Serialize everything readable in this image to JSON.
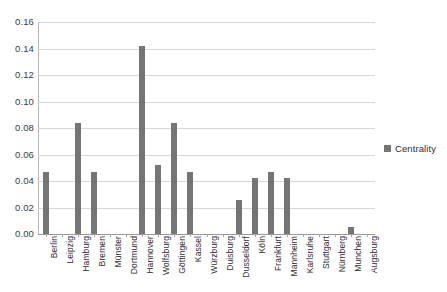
{
  "chart_data": {
    "type": "bar",
    "title": "",
    "subtitle": "",
    "xlabel": "",
    "ylabel": "",
    "ylim": [
      0.0,
      0.16
    ],
    "ytick_step": 0.02,
    "ytick_labels": [
      "0.16",
      "0.14",
      "0.12",
      "0.10",
      "0.08",
      "0.06",
      "0.04",
      "0.02",
      "0.00"
    ],
    "ytick_values": [
      0.16,
      0.14,
      0.12,
      0.1,
      0.08,
      0.06,
      0.04,
      0.02,
      0.0
    ],
    "grid": true,
    "legend_position": "right",
    "bar_color": "#757575",
    "gridline_color": "#d6d6d6",
    "background_color": "#ffffff",
    "categories": [
      "Berlin",
      "Leipzig",
      "Hamburg",
      "Bremen",
      "Münster",
      "Dortmund",
      "Hannover",
      "Wolfsburg",
      "Göttingen",
      "Kassel",
      "Würzburg",
      "Duisburg",
      "Dusseldorf",
      "Köln",
      "Frankfurt",
      "Mannheim",
      "Karlsruhe",
      "Stuttgart",
      "Nürnberg",
      "Munchen",
      "Augsburg"
    ],
    "series": [
      {
        "name": "Centrality",
        "values": [
          0.047,
          0.0,
          0.084,
          0.047,
          0.0,
          0.0,
          0.142,
          0.052,
          0.084,
          0.047,
          0.0,
          0.0,
          0.026,
          0.042,
          0.047,
          0.042,
          0.0,
          0.0,
          0.0,
          0.005,
          0.0
        ]
      }
    ]
  },
  "legend": {
    "entries": [
      {
        "label": "Centrality",
        "color": "#757575",
        "marker": "square-marker"
      }
    ]
  }
}
